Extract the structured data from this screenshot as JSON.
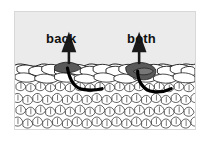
{
  "figure": {
    "background_color": "#ebebeb",
    "border_color": "#d8d8d8",
    "fabric_color": "#ffffff",
    "outline_color": "#1a1a1a",
    "highlight_color": "#595959",
    "arrow_color": "#1a1a1a",
    "labels": [
      {
        "id": "back",
        "text": "back"
      },
      {
        "id": "both",
        "text": "both"
      }
    ],
    "annotations": {
      "back_arrow": "up-arrow",
      "both_arrow": "up-arrow",
      "back_hook_path": "curved-hook-through-back-loop",
      "both_hook_path": "curved-hook-through-both-loops"
    },
    "rows": {
      "top_row_label": "working-row-of-stitches",
      "lower_rows_label": "completed-fabric-texture"
    }
  }
}
